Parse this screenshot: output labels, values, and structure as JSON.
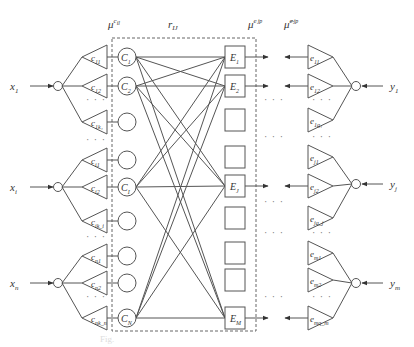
{
  "header_labels": {
    "mu_c": "μ",
    "mu_c_sup": "c",
    "mu_c_sup2": "il",
    "r": "r",
    "r_sub": "IJ",
    "mu_e": "μ",
    "mu_e_sup": "e",
    "mu_e_sup2": "jp",
    "mu_hat": "μ̂",
    "mu_hat_sup": "e",
    "mu_hat_sup2": "jp"
  },
  "inputs": [
    {
      "label": "x",
      "sub": "1",
      "y": 86
    },
    {
      "label": "x",
      "sub": "i",
      "y": 187
    },
    {
      "label": "x",
      "sub": "n",
      "y": 283
    }
  ],
  "outputs": [
    {
      "label": "y",
      "sub": "1",
      "y": 86
    },
    {
      "label": "y",
      "sub": "j",
      "y": 184
    },
    {
      "label": "y",
      "sub": "m",
      "y": 283
    }
  ],
  "left_triangles": [
    {
      "label": "c",
      "sub": "11",
      "y": 57,
      "group": 0
    },
    {
      "label": "c",
      "sub": "12",
      "y": 86,
      "group": 0
    },
    {
      "label": "c",
      "sub": "1k₁",
      "y": 122,
      "group": 0
    },
    {
      "label": "c",
      "sub": "i1",
      "y": 160,
      "group": 1
    },
    {
      "label": "c",
      "sub": "i2",
      "y": 187,
      "group": 1
    },
    {
      "label": "c",
      "sub": "ik_i",
      "y": 221,
      "group": 1
    },
    {
      "label": "c",
      "sub": "n1",
      "y": 256,
      "group": 2
    },
    {
      "label": "c",
      "sub": "n2",
      "y": 283,
      "group": 2
    },
    {
      "label": "c",
      "sub": "nk_n",
      "y": 318,
      "group": 2
    }
  ],
  "left_dots_y": [
    103,
    143,
    240,
    300
  ],
  "c_nodes": [
    {
      "label": "C",
      "sub": "1",
      "y": 57
    },
    {
      "label": "C",
      "sub": "2",
      "y": 86
    },
    {
      "label": "",
      "sub": "",
      "y": 122
    },
    {
      "label": "",
      "sub": "",
      "y": 160
    },
    {
      "label": "C",
      "sub": "I",
      "y": 187
    },
    {
      "label": "",
      "sub": "",
      "y": 221
    },
    {
      "label": "",
      "sub": "",
      "y": 256
    },
    {
      "label": "",
      "sub": "",
      "y": 283
    },
    {
      "label": "C",
      "sub": "N",
      "y": 318
    }
  ],
  "e_boxes": [
    {
      "label": "E",
      "sub": "1",
      "y": 57
    },
    {
      "label": "E",
      "sub": "2",
      "y": 86
    },
    {
      "label": "",
      "sub": "",
      "y": 120
    },
    {
      "label": "",
      "sub": "",
      "y": 157
    },
    {
      "label": "E",
      "sub": "J",
      "y": 186
    },
    {
      "label": "",
      "sub": "",
      "y": 218
    },
    {
      "label": "",
      "sub": "",
      "y": 253
    },
    {
      "label": "",
      "sub": "",
      "y": 280
    },
    {
      "label": "E",
      "sub": "M",
      "y": 318
    }
  ],
  "right_triangles": [
    {
      "label": "e",
      "sub": "11",
      "y": 57,
      "group": 0
    },
    {
      "label": "e",
      "sub": "12",
      "y": 86,
      "group": 0
    },
    {
      "label": "e",
      "sub": "1q₁",
      "y": 120,
      "group": 0
    },
    {
      "label": "e",
      "sub": "j1",
      "y": 157,
      "group": 1
    },
    {
      "label": "e",
      "sub": "j2",
      "y": 186,
      "group": 1
    },
    {
      "label": "e",
      "sub": "jq_j",
      "y": 218,
      "group": 1
    },
    {
      "label": "e",
      "sub": "m1",
      "y": 253,
      "group": 2
    },
    {
      "label": "e",
      "sub": "m2",
      "y": 280,
      "group": 2
    },
    {
      "label": "e",
      "sub": "mq_m",
      "y": 318,
      "group": 2
    }
  ],
  "right_dots_y": [
    103,
    140,
    236,
    300
  ],
  "mid_dots_y": [
    103,
    140,
    205,
    236,
    300
  ],
  "connections": [
    [
      0,
      0
    ],
    [
      0,
      1
    ],
    [
      0,
      4
    ],
    [
      0,
      8
    ],
    [
      1,
      0
    ],
    [
      1,
      1
    ],
    [
      1,
      4
    ],
    [
      1,
      8
    ],
    [
      4,
      0
    ],
    [
      4,
      1
    ],
    [
      4,
      4
    ],
    [
      4,
      8
    ],
    [
      8,
      0
    ],
    [
      8,
      1
    ],
    [
      8,
      4
    ],
    [
      8,
      8
    ]
  ],
  "caption": "Fig."
}
